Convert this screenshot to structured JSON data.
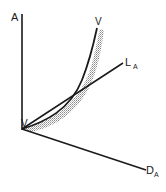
{
  "diagram": {
    "labels": {
      "vertical_axis": "A",
      "horizontal_axis_main": "D",
      "horizontal_axis_sub": "A",
      "line_main": "L",
      "line_sub": "A",
      "curve_top": "V",
      "curve_origin": "V"
    },
    "colors": {
      "ink": "#1a1a1a",
      "stipple": "#9a9a9a",
      "background": "#ffffff"
    }
  }
}
